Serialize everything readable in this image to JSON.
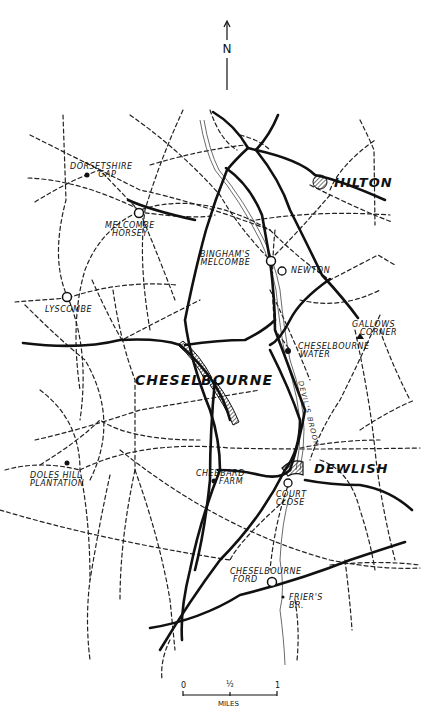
{
  "north": {
    "label": "N"
  },
  "places": {
    "dorsetshire_gap": [
      "DORSETSHIRE",
      "GAP"
    ],
    "melcombe_horsey": [
      "MELCOMBE",
      "HORSEY"
    ],
    "hilton": "HILTON",
    "binghams_melcombe": [
      "BINGHAM'S",
      "MELCOMBE"
    ],
    "newton": "NEWTON",
    "lyscombe": "LYSCOMBE",
    "gallows_corner": [
      "GALLOWS",
      "CORNER"
    ],
    "cheselbourne_water": [
      "CHESELBOURNE",
      "WATER"
    ],
    "cheselbourne": "CHESELBOURNE",
    "devils_brook": "DEVIL'S BROOK",
    "doles_hill_plantation": [
      "DOLES HILL",
      "PLANTATION"
    ],
    "chebbard_farm": [
      "CHEBBARD",
      "FARM"
    ],
    "dewlish": "DEWLISH",
    "court_close": [
      "COURT",
      "CLOSE"
    ],
    "cheselbourne_ford": [
      "CHESELBOURNE",
      "FORD"
    ],
    "friers_br": [
      "FRIER'S",
      "BR."
    ]
  },
  "scale": {
    "ticks": [
      "0",
      "½",
      "1"
    ],
    "unit": "MILES"
  },
  "legend_symbols": {
    "road": "solid-line",
    "footpath": "dashed-line",
    "river": "thin-line",
    "village": "hatched-area",
    "hamlet": "open-circle",
    "site": "filled-dot"
  }
}
